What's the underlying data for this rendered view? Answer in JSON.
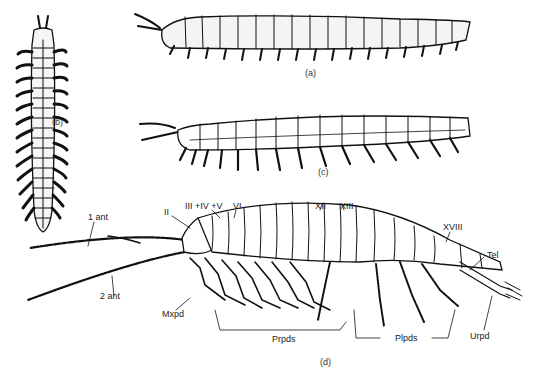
{
  "figure": {
    "header_text": "",
    "captions": {
      "a": "(a)",
      "b": "(b)",
      "c": "(c)",
      "d": "(d)"
    },
    "labels": {
      "ant1": "1 ant",
      "ant2": "2 ant",
      "seg2": "II",
      "seg345": "III +IV +V",
      "seg6": "VI",
      "seg12": "XII",
      "seg13": "XIII",
      "seg18": "XVIII",
      "tel": "Tel",
      "mxpd": "Mxpd",
      "prpds": "Prpds",
      "plpds": "Plpds",
      "urpd": "Urpd"
    }
  }
}
